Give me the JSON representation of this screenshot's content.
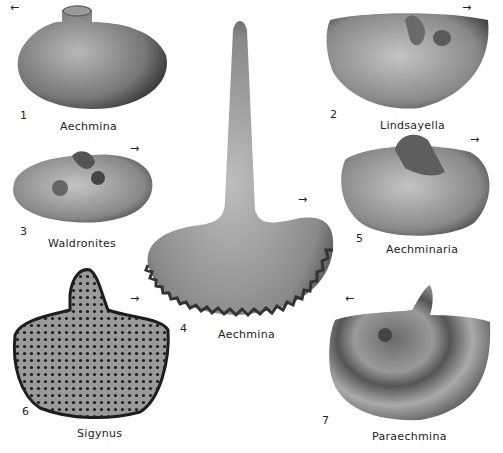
{
  "plate": {
    "figures": [
      {
        "number": "1",
        "genus": "Aechmina",
        "orientation_arrow": "←"
      },
      {
        "number": "2",
        "genus": "Lindsayella",
        "orientation_arrow": "→"
      },
      {
        "number": "3",
        "genus": "Waldronites",
        "orientation_arrow": "→"
      },
      {
        "number": "4",
        "genus": "Aechmina",
        "orientation_arrow": "→"
      },
      {
        "number": "5",
        "genus": "Aechminaria",
        "orientation_arrow": "→"
      },
      {
        "number": "6",
        "genus": "Sigynus",
        "orientation_arrow": "→"
      },
      {
        "number": "7",
        "genus": "Paraechmina",
        "orientation_arrow": "←"
      }
    ]
  }
}
